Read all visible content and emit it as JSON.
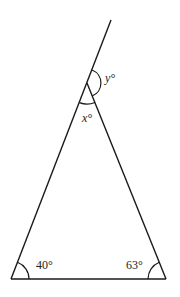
{
  "diagram": {
    "type": "triangle-with-extended-side",
    "colors": {
      "stroke": "#1a1a1a",
      "text": "#222222",
      "background": "#ffffff"
    },
    "vertices": {
      "bottom_left": [
        11,
        279
      ],
      "bottom_right": [
        166,
        279
      ],
      "apex": [
        87,
        83
      ],
      "extension_end": [
        111,
        20
      ]
    },
    "angles": {
      "bottom_left": {
        "value": 40,
        "label": "40°"
      },
      "bottom_right": {
        "value": 63,
        "label": "63°"
      },
      "apex_interior": {
        "variable": "x",
        "label": "x°"
      },
      "apex_exterior": {
        "variable": "y",
        "label": "y°"
      }
    }
  }
}
